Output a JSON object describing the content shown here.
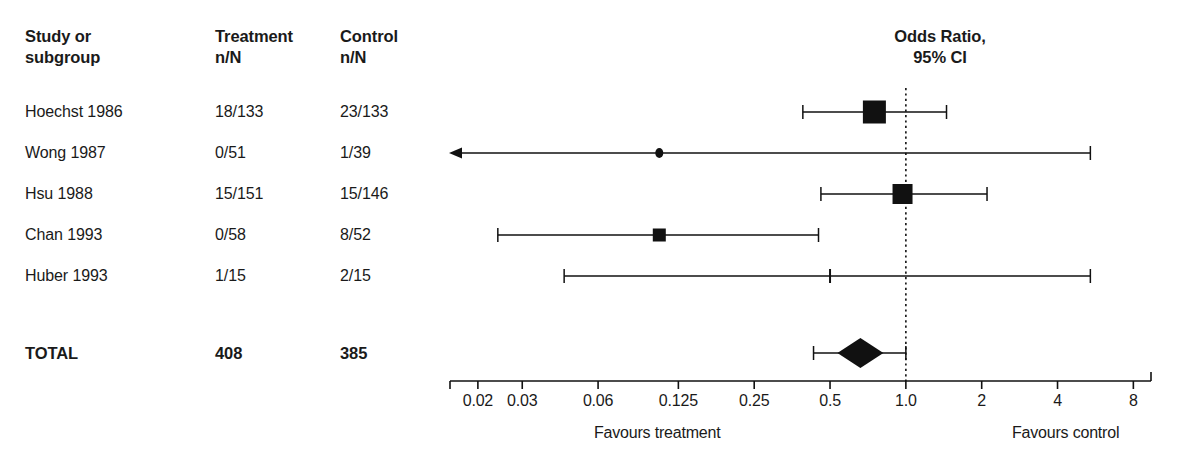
{
  "table": {
    "headers": {
      "study": "Study or\nsubgroup",
      "treatment": "Treatment\nn/N",
      "control": "Control\nn/N"
    },
    "rows": [
      {
        "study": "Hoechst 1986",
        "treatment": "18/133",
        "control": "23/133"
      },
      {
        "study": "Wong 1987",
        "treatment": "0/51",
        "control": "1/39"
      },
      {
        "study": "Hsu 1988",
        "treatment": "15/151",
        "control": "15/146"
      },
      {
        "study": "Chan 1993",
        "treatment": "0/58",
        "control": "8/52"
      },
      {
        "study": "Huber 1993",
        "treatment": "1/15",
        "control": "2/15"
      }
    ],
    "total": {
      "study": "TOTAL",
      "treatment": "408",
      "control": "385"
    }
  },
  "plot": {
    "title": "Odds Ratio,\n95% CI",
    "favours_treatment": "Favours treatment",
    "favours_control": "Favours control",
    "null_line_value": "1.0",
    "colors": {
      "ink": "#111111",
      "line": "#333333",
      "marker": "#000000"
    }
  },
  "chart_data": {
    "type": "forest",
    "title": "Odds Ratio, 95% CI",
    "xlabel": "Odds Ratio",
    "xscale": "log",
    "xlim": [
      0.0155,
      9.4
    ],
    "grid": false,
    "null_value": 1.0,
    "tick_values": [
      0.02,
      0.03,
      0.06,
      0.125,
      0.25,
      0.5,
      1.0,
      2,
      4,
      8
    ],
    "tick_labels": [
      "0.02",
      "0.03",
      "0.06",
      "0.125",
      "0.25",
      "0.5",
      "1.0",
      "2",
      "4",
      "8"
    ],
    "axis_captions": {
      "left": "Favours treatment",
      "right": "Favours control"
    },
    "columns": [
      "Study or subgroup",
      "Treatment n/N",
      "Control n/N"
    ],
    "studies": [
      {
        "label": "Hoechst 1986",
        "treatment": "18/133",
        "control": "23/133",
        "estimate": 0.75,
        "ci_low": 0.39,
        "ci_high": 1.45,
        "marker": "square",
        "marker_size": 23,
        "arrow_left": false,
        "arrow_right": false
      },
      {
        "label": "Wong 1987",
        "treatment": "0/51",
        "control": "1/39",
        "estimate": 0.105,
        "ci_low": 0.016,
        "ci_high": 5.4,
        "marker": "dot",
        "marker_size": 8,
        "arrow_left": true,
        "arrow_right": false
      },
      {
        "label": "Hsu 1988",
        "treatment": "15/151",
        "control": "15/146",
        "estimate": 0.97,
        "ci_low": 0.46,
        "ci_high": 2.1,
        "marker": "square",
        "marker_size": 20,
        "arrow_left": false,
        "arrow_right": false
      },
      {
        "label": "Chan 1993",
        "treatment": "0/58",
        "control": "8/52",
        "estimate": 0.105,
        "ci_low": 0.024,
        "ci_high": 0.45,
        "marker": "square",
        "marker_size": 13,
        "arrow_left": false,
        "arrow_right": false
      },
      {
        "label": "Huber 1993",
        "treatment": "1/15",
        "control": "2/15",
        "estimate": 0.5,
        "ci_low": 0.044,
        "ci_high": 5.4,
        "marker": "tick",
        "marker_size": 2,
        "arrow_left": false,
        "arrow_right": false
      }
    ],
    "total": {
      "label": "TOTAL",
      "treatment": "408",
      "control": "385",
      "estimate": 0.66,
      "ci_low": 0.43,
      "ci_high": 1.0,
      "marker": "diamond"
    }
  }
}
